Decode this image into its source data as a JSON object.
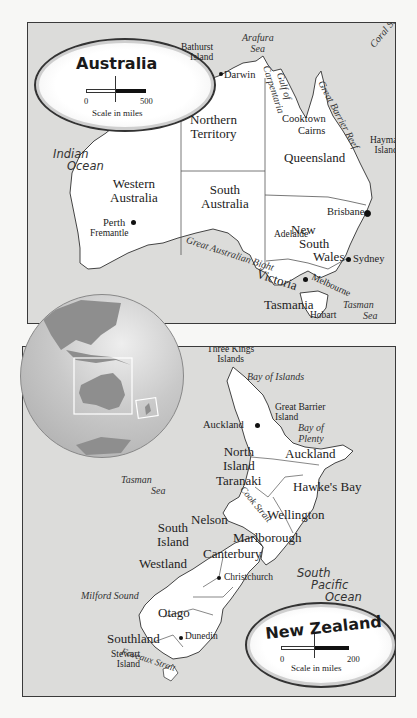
{
  "australia_map": {
    "legend": {
      "title": "Australia",
      "scale_min": "0",
      "scale_max": "500",
      "scale_label": "Scale in miles",
      "north_marker": "N"
    },
    "regions": [
      {
        "name": "Western Australia",
        "line1": "Western",
        "line2": "Australia"
      },
      {
        "name": "Northern Territory",
        "line1": "Northern",
        "line2": "Territory"
      },
      {
        "name": "Queensland",
        "line1": "Queensland",
        "line2": ""
      },
      {
        "name": "South Australia",
        "line1": "South",
        "line2": "Australia"
      },
      {
        "name": "New South Wales",
        "line1": "New",
        "line2": "South",
        "line3": "Wales"
      },
      {
        "name": "Victoria",
        "line1": "Victoria",
        "line2": ""
      },
      {
        "name": "Tasmania",
        "line1": "Tasmania",
        "line2": ""
      }
    ],
    "cities": [
      "Darwin",
      "Cooktown",
      "Cairns",
      "Brisbane",
      "Sydney",
      "Melbourne",
      "Hobart",
      "Adelaide",
      "Perth",
      "Fremantle"
    ],
    "islands": [
      {
        "line1": "Bathurst",
        "line2": "Island"
      },
      {
        "line1": "Hayman",
        "line2": "Island"
      }
    ],
    "waters": {
      "arafura": {
        "line1": "Arafura",
        "line2": "Sea"
      },
      "gulf": {
        "line1": "Gulf of",
        "line2": "Carpentaria"
      },
      "reef": "Great Barrier Reef",
      "coral": "Coral Sea",
      "bight": "Great Australian Bight",
      "tasman": {
        "line1": "Tasman",
        "line2": "Sea"
      },
      "indian": {
        "line1": "Indian",
        "line2": "Ocean"
      }
    }
  },
  "new_zealand_map": {
    "legend": {
      "title": "New Zealand",
      "scale_min": "0",
      "scale_max": "200",
      "scale_label": "Scale in miles",
      "north_marker": "N"
    },
    "regions": {
      "north_island": {
        "line1": "North",
        "line2": "Island"
      },
      "south_island": {
        "line1": "South",
        "line2": "Island"
      },
      "auckland_region": "Auckland",
      "taranaki": "Taranaki",
      "hawkes_bay": "Hawke's Bay",
      "wellington": "Wellington",
      "nelson": "Nelson",
      "marlborough": "Marlborough",
      "westland": "Westland",
      "canterbury": "Canterbury",
      "otago": "Otago",
      "southland": "Southland"
    },
    "cities": [
      "Auckland",
      "Christchurch",
      "Dunedin"
    ],
    "islands": {
      "three_kings": {
        "line1": "Three Kings",
        "line2": "Islands"
      },
      "great_barrier": {
        "line1": "Great Barrier",
        "line2": "Island"
      },
      "stewart": {
        "line1": "Stewart",
        "line2": "Island"
      }
    },
    "waters": {
      "bay_of_islands": "Bay of Islands",
      "bay_of_plenty": {
        "line1": "Bay of",
        "line2": "Plenty"
      },
      "tasman": {
        "line1": "Tasman",
        "line2": "Sea"
      },
      "cook_strait": "Cook Strait",
      "milford": "Milford Sound",
      "foveaux": "Foveaux Strait",
      "pacific": {
        "line1": "South",
        "line2": "Pacific",
        "line3": "Ocean"
      }
    }
  },
  "locator_globe": {
    "boxes": [
      "Australia",
      "New Zealand"
    ]
  },
  "colors": {
    "water": "#dcdcda",
    "land": "#ffffff",
    "border": "#3a3a3a",
    "globe_land": "#8e8e8e"
  }
}
